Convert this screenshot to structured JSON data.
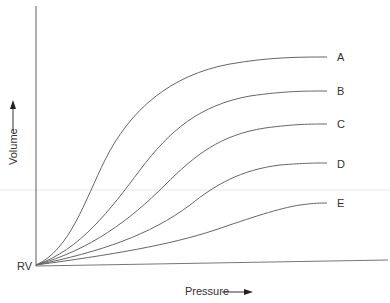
{
  "diagram": {
    "type": "pressure-volume curves",
    "y_axis": {
      "label": "Volume",
      "arrow": "up-arrow"
    },
    "x_axis": {
      "label": "Pressure",
      "arrow": "right-arrow"
    },
    "origin_label": "RV",
    "curves": [
      {
        "label": "A"
      },
      {
        "label": "B"
      },
      {
        "label": "C"
      },
      {
        "label": "D"
      },
      {
        "label": "E"
      }
    ],
    "colors": {
      "line": "#666666",
      "text": "#333333"
    }
  }
}
